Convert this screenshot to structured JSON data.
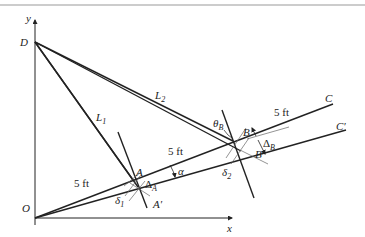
{
  "figure": {
    "axes": {
      "x_label": "x",
      "y_label": "y"
    },
    "points": {
      "O": "O",
      "D": "D",
      "A": "A",
      "A_prime": "A′",
      "B": "B",
      "B_prime": "B′",
      "C": "C",
      "C_prime": "C′"
    },
    "lines": {
      "L1": "L",
      "L1_sub": "1",
      "L2": "L",
      "L2_sub": "2"
    },
    "dimensions": {
      "OA": "5 ft",
      "AB": "5 ft",
      "BC": "5 ft"
    },
    "angles": {
      "alpha": "α",
      "theta_B": "θ",
      "theta_B_sub": "B"
    },
    "displacements": {
      "delta_A": "Δ",
      "delta_A_sub": "A",
      "delta_B": "Δ",
      "delta_B_sub": "B",
      "delta_1": "δ",
      "delta_1_sub": "1",
      "delta_2": "δ",
      "delta_2_sub": "2"
    }
  }
}
